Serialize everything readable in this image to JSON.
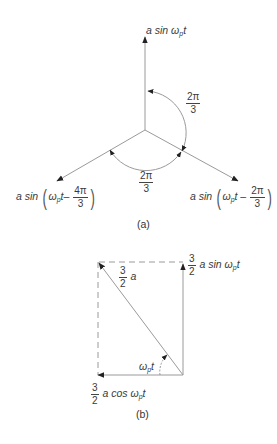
{
  "figure_a": {
    "caption": "(a)",
    "vectors": [
      {
        "label_prefix": "a sin ",
        "omega": "ω",
        "sub": "p",
        "suffix": "t",
        "angle_deg": 90
      },
      {
        "label_prefix": "a sin",
        "omega": "ω",
        "sub": "p",
        "suffix": "t –",
        "frac_num": "2π",
        "frac_den": "3",
        "angle_deg": -30
      },
      {
        "label_prefix": "a sin",
        "omega": "ω",
        "sub": "p",
        "suffix": "t–",
        "frac_num": "4π",
        "frac_den": "3",
        "angle_deg": 210
      }
    ],
    "angle_labels": [
      {
        "num": "2π",
        "den": "3"
      },
      {
        "num": "2π",
        "den": "3"
      }
    ]
  },
  "figure_b": {
    "caption": "(b)",
    "sin_component": {
      "frac_num": "3",
      "frac_den": "2",
      "text": " a sin ",
      "omega": "ω",
      "sub": "p",
      "suffix": "t"
    },
    "resultant": {
      "frac_num": "3",
      "frac_den": "2",
      "text": " a"
    },
    "angle": {
      "omega": "ω",
      "sub": "p",
      "suffix": "t"
    },
    "cos_component": {
      "frac_num": "3",
      "frac_den": "2",
      "text": " a cos ",
      "omega": "ω",
      "sub": "p",
      "suffix": "t"
    }
  },
  "colors": {
    "line": "#9a9a9a",
    "arrow": "#222222",
    "text": "#3a3a3a"
  }
}
